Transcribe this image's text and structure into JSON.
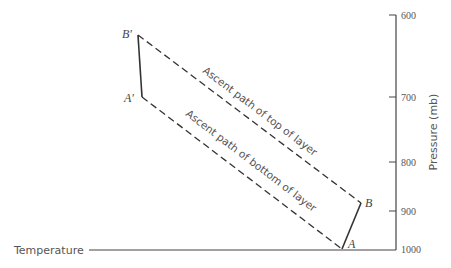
{
  "diagram": {
    "axis": {
      "title": "Pressure (mb)",
      "ticks": [
        {
          "label": "600",
          "y": 15
        },
        {
          "label": "700",
          "y": 97
        },
        {
          "label": "800",
          "y": 162
        },
        {
          "label": "900",
          "y": 211
        },
        {
          "label": "1000",
          "y": 249
        }
      ]
    },
    "x_axis_label": "Temperature",
    "points": {
      "B_prime": {
        "label": "B′",
        "x": 138,
        "y": 35
      },
      "A_prime": {
        "label": "A′",
        "x": 142,
        "y": 97
      },
      "B": {
        "label": "B",
        "x": 361,
        "y": 203
      },
      "A": {
        "label": "A",
        "x": 342,
        "y": 249
      }
    },
    "paths": {
      "top": "Ascent path of top of layer",
      "bottom": "Ascent path of bottom of layer"
    },
    "colors": {
      "line": "#333333",
      "text": "#555555"
    }
  }
}
